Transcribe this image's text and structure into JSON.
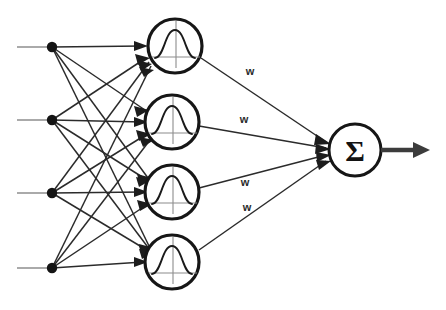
{
  "figure": {
    "name": "rbf-network-diagram",
    "background_color": "#ffffff",
    "width": 446,
    "height": 310
  },
  "colors": {
    "edge": "#2b2b2b",
    "input_lead": "#8e8e8e",
    "node_outline": "#161616",
    "dot": "#141414",
    "curve": "#1a1a1a",
    "axis": "#8c8c8c",
    "output_arrow": "#3c3c3c",
    "text": "#2a2a2a"
  },
  "input_layer": {
    "label": "input-nodes",
    "count": 4,
    "nodes": [
      {
        "id": "input-1",
        "cx": 52,
        "cy": 47,
        "r": 5,
        "lead_x": 17
      },
      {
        "id": "input-2",
        "cx": 52,
        "cy": 120,
        "r": 5,
        "lead_x": 17
      },
      {
        "id": "input-3",
        "cx": 52,
        "cy": 193,
        "r": 5,
        "lead_x": 17
      },
      {
        "id": "input-4",
        "cx": 52,
        "cy": 268,
        "r": 5,
        "lead_x": 17
      }
    ]
  },
  "hidden_layer": {
    "label": "rbf-neurons",
    "count": 4,
    "neuron_radius": 27,
    "glyph": "gaussian-bell-curve",
    "neurons": [
      {
        "id": "rbf-neuron-1",
        "cx": 175,
        "cy": 46
      },
      {
        "id": "rbf-neuron-2",
        "cx": 172,
        "cy": 122
      },
      {
        "id": "rbf-neuron-3",
        "cx": 172,
        "cy": 192
      },
      {
        "id": "rbf-neuron-4",
        "cx": 172,
        "cy": 262
      }
    ]
  },
  "output_layer": {
    "label": "summation-node",
    "id": "sum-node",
    "cx": 355,
    "cy": 150,
    "r": 26,
    "symbol": "Σ"
  },
  "weights": {
    "label": "connection-weights",
    "items": [
      {
        "id": "weight-1",
        "text": "w",
        "x": 250,
        "y": 75
      },
      {
        "id": "weight-2",
        "text": "w",
        "x": 244,
        "y": 123
      },
      {
        "id": "weight-3",
        "text": "w",
        "x": 245,
        "y": 186
      },
      {
        "id": "weight-4",
        "text": "w",
        "x": 247,
        "y": 211
      }
    ]
  },
  "output_arrow": {
    "label": "output-arrow",
    "x_start": 381,
    "x_end": 430,
    "y": 150,
    "thickness": 4.6
  },
  "connections": {
    "label": "fully-connected-input-to-hidden",
    "total_edges": 16,
    "hidden_to_sum_edges": 4
  }
}
